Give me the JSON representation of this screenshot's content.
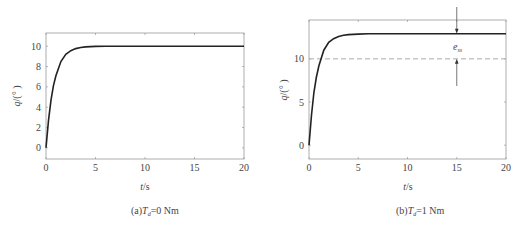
{
  "chart_data": [
    {
      "type": "line",
      "panel": "a",
      "caption": "(a)T_d=0 Nm",
      "caption_parts": {
        "prefix": "(a)",
        "var": "T",
        "sub": "d",
        "suffix": "=0 Nm"
      },
      "xlabel": "t/s",
      "ylabel": "q/(°)",
      "xlim": [
        0,
        20
      ],
      "ylim": [
        -1.1,
        11.3
      ],
      "xticks": [
        0,
        5,
        10,
        15,
        20
      ],
      "yticks": [
        0,
        2,
        4,
        6,
        8,
        10
      ],
      "grid": false,
      "series": [
        {
          "name": "q",
          "x": [
            0,
            0.25,
            0.5,
            0.75,
            1.0,
            1.5,
            2.0,
            2.5,
            3.0,
            3.5,
            4.0,
            5.0,
            6.0,
            8.0,
            10.0,
            15.0,
            20.0
          ],
          "y": [
            0,
            2.7,
            4.7,
            6.1,
            7.1,
            8.5,
            9.2,
            9.56,
            9.76,
            9.87,
            9.93,
            9.98,
            10.0,
            10.0,
            10.0,
            10.0,
            10.0
          ]
        }
      ]
    },
    {
      "type": "line",
      "panel": "b",
      "caption": "(b)T_d=1 Nm",
      "caption_parts": {
        "prefix": "(b)",
        "var": "T",
        "sub": "d",
        "suffix": "=1 Nm"
      },
      "xlabel": "t/s",
      "ylabel": "q/(°)",
      "xlim": [
        0,
        20
      ],
      "ylim": [
        -1.6,
        14.5
      ],
      "xticks": [
        0,
        5,
        10,
        15,
        20
      ],
      "yticks": [
        0,
        5,
        10
      ],
      "grid": false,
      "reference_line": {
        "y": 10,
        "style": "dashed"
      },
      "annotation": {
        "text": "e_ss",
        "var": "e",
        "sub": "ss",
        "x": 15,
        "from_y": 10,
        "to_y": 12.9
      },
      "series": [
        {
          "name": "q",
          "x": [
            0,
            0.25,
            0.5,
            0.75,
            1.0,
            1.5,
            2.0,
            2.5,
            3.0,
            3.5,
            4.0,
            5.0,
            6.0,
            8.0,
            10.0,
            15.0,
            20.0
          ],
          "y": [
            0,
            3.5,
            6.1,
            7.9,
            9.2,
            11.0,
            11.9,
            12.33,
            12.59,
            12.73,
            12.81,
            12.87,
            12.9,
            12.9,
            12.9,
            12.9,
            12.9
          ]
        }
      ]
    }
  ]
}
